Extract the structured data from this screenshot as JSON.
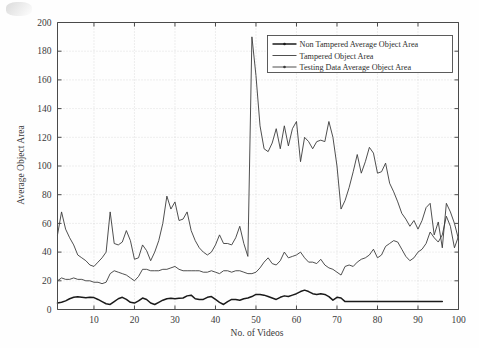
{
  "chart_data": {
    "type": "line",
    "title": "",
    "xlabel": "No. of Videos",
    "ylabel": "Average Object Area",
    "xlim": [
      1,
      100
    ],
    "ylim": [
      0,
      200
    ],
    "xticks": [
      10,
      20,
      30,
      40,
      50,
      60,
      70,
      80,
      90,
      100
    ],
    "yticks": [
      0,
      20,
      40,
      60,
      80,
      100,
      120,
      140,
      160,
      180,
      200
    ],
    "grid": true,
    "legend_position": "top-right",
    "series": [
      {
        "name": "Non Tampered Average Object Area",
        "color": "#1a1a1a",
        "marker": "dot",
        "line_width": 1.5,
        "x": [
          1,
          2,
          3,
          4,
          5,
          6,
          7,
          8,
          9,
          10,
          11,
          12,
          13,
          14,
          15,
          16,
          17,
          18,
          19,
          20,
          21,
          22,
          23,
          24,
          25,
          26,
          27,
          28,
          29,
          30,
          31,
          32,
          33,
          34,
          35,
          36,
          37,
          38,
          39,
          40,
          41,
          42,
          43,
          44,
          45,
          46,
          47,
          48,
          49,
          50,
          51,
          52,
          53,
          54,
          55,
          56,
          57,
          58,
          59,
          60,
          61,
          62,
          63,
          64,
          65,
          66,
          67,
          68,
          69,
          70,
          71,
          72,
          73,
          74,
          75,
          76,
          77,
          78,
          79,
          80,
          81,
          82,
          83,
          84,
          85,
          86,
          87,
          88,
          89,
          90,
          91,
          92,
          93,
          94,
          95,
          96
        ],
        "values": [
          4.5,
          5.0,
          6.0,
          7.5,
          8.5,
          8.8,
          8.5,
          8.2,
          8.5,
          8.3,
          7.0,
          5.5,
          4.0,
          3.5,
          5.5,
          7.5,
          8.5,
          7.0,
          5.0,
          4.5,
          6.0,
          8.0,
          7.0,
          4.5,
          3.5,
          5.0,
          6.5,
          7.5,
          7.8,
          7.5,
          7.8,
          8.0,
          9.5,
          10.0,
          7.5,
          7.0,
          7.0,
          8.5,
          9.0,
          7.0,
          5.0,
          3.5,
          5.5,
          7.0,
          7.0,
          6.5,
          7.5,
          8.0,
          9.0,
          10.5,
          10.5,
          10.0,
          9.0,
          8.0,
          7.0,
          8.5,
          9.5,
          9.0,
          10.0,
          11.0,
          12.5,
          13.5,
          12.5,
          11.0,
          10.5,
          11.0,
          10.5,
          9.0,
          6.5,
          8.5,
          8.0,
          5.5,
          5.5,
          5.5,
          5.5,
          5.5,
          5.5,
          5.5,
          5.5,
          5.5,
          5.5,
          5.5,
          5.5,
          5.5,
          5.5,
          5.5,
          5.5,
          5.5,
          5.5,
          5.5,
          5.5,
          5.5,
          5.5,
          5.5,
          5.5,
          5.5
        ]
      },
      {
        "name": "Tampered Object Area",
        "color": "#3b3b3b",
        "marker": "none",
        "line_width": 0.9,
        "x": [
          1,
          2,
          3,
          4,
          5,
          6,
          7,
          8,
          9,
          10,
          11,
          12,
          13,
          14,
          15,
          16,
          17,
          18,
          19,
          20,
          21,
          22,
          23,
          24,
          25,
          26,
          27,
          28,
          29,
          30,
          31,
          32,
          33,
          34,
          35,
          36,
          37,
          38,
          39,
          40,
          41,
          42,
          43,
          44,
          45,
          46,
          47,
          48,
          49,
          50,
          51,
          52,
          53,
          54,
          55,
          56,
          57,
          58,
          59,
          60,
          61,
          62,
          63,
          64,
          65,
          66,
          67,
          68,
          69,
          70,
          71,
          72,
          73,
          74,
          75,
          76,
          77,
          78,
          79,
          80,
          81,
          82,
          83,
          84,
          85,
          86,
          87,
          88,
          89,
          90,
          91,
          92,
          93,
          94,
          95,
          96,
          97,
          98,
          99,
          100
        ],
        "values": [
          52,
          68,
          56,
          50,
          45,
          38,
          36,
          34,
          31,
          30,
          33,
          36,
          40,
          68,
          46,
          45,
          47,
          55,
          48,
          35,
          36,
          45,
          41,
          34,
          40,
          48,
          60,
          79,
          70,
          75,
          62,
          63,
          68,
          55,
          48,
          43,
          40,
          38,
          40,
          45,
          52,
          46,
          46,
          45,
          50,
          58,
          46,
          37,
          190,
          163,
          128,
          112,
          110,
          116,
          126,
          112,
          128,
          114,
          126,
          131,
          103,
          120,
          117,
          112,
          117,
          118,
          117,
          131,
          120,
          100,
          70,
          76,
          85,
          96,
          108,
          95,
          103,
          113,
          109,
          95,
          96,
          102,
          88,
          82,
          75,
          67,
          63,
          58,
          62,
          56,
          62,
          71,
          74,
          52,
          61,
          43,
          74,
          68,
          60,
          49
        ]
      },
      {
        "name": "Testing Data Average Object Area",
        "color": "#3b3b3b",
        "marker": "dot",
        "line_width": 0.9,
        "x": [
          1,
          2,
          3,
          4,
          5,
          6,
          7,
          8,
          9,
          10,
          11,
          12,
          13,
          14,
          15,
          16,
          17,
          18,
          19,
          20,
          21,
          22,
          23,
          24,
          25,
          26,
          27,
          28,
          29,
          30,
          31,
          32,
          33,
          34,
          35,
          36,
          37,
          38,
          39,
          40,
          41,
          42,
          43,
          44,
          45,
          46,
          47,
          48,
          49,
          50,
          51,
          52,
          53,
          54,
          55,
          56,
          57,
          58,
          59,
          60,
          61,
          62,
          63,
          64,
          65,
          66,
          67,
          68,
          69,
          70,
          71,
          72,
          73,
          74,
          75,
          76,
          77,
          78,
          79,
          80,
          81,
          82,
          83,
          84,
          85,
          86,
          87,
          88,
          89,
          90,
          91,
          92,
          93,
          94,
          95,
          96,
          97,
          98,
          99,
          100
        ],
        "values": [
          20,
          22,
          21,
          21,
          22,
          21,
          21,
          20,
          20,
          19,
          19,
          18,
          19,
          25,
          27,
          26,
          25,
          24,
          22,
          20,
          23,
          28,
          28,
          27,
          27,
          27,
          28,
          28,
          29,
          30,
          28,
          27,
          27,
          27,
          27,
          27,
          26,
          26,
          27,
          26,
          25,
          27,
          27,
          26,
          27,
          27,
          26,
          25,
          25,
          26,
          29,
          33,
          36,
          32,
          31,
          34,
          40,
          36,
          37,
          38,
          40,
          36,
          33,
          33,
          32,
          35,
          31,
          29,
          28,
          26,
          24,
          30,
          31,
          30,
          33,
          35,
          36,
          38,
          42,
          36,
          38,
          44,
          46,
          48,
          47,
          42,
          37,
          34,
          36,
          40,
          42,
          46,
          54,
          50,
          47,
          52,
          65,
          58,
          43,
          51
        ]
      }
    ]
  },
  "legend": {
    "items": [
      {
        "label": "Non Tampered Average Object Area"
      },
      {
        "label": "Tampered Object Area"
      },
      {
        "label": "Testing Data Average Object Area"
      }
    ]
  },
  "axes": {
    "x_title": "No. of Videos",
    "y_title": "Average Object Area",
    "x_tick_labels": [
      "10",
      "20",
      "30",
      "40",
      "50",
      "60",
      "70",
      "80",
      "90",
      "100"
    ],
    "y_tick_labels": [
      "0",
      "20",
      "40",
      "60",
      "80",
      "100",
      "120",
      "140",
      "160",
      "180",
      "200"
    ]
  }
}
